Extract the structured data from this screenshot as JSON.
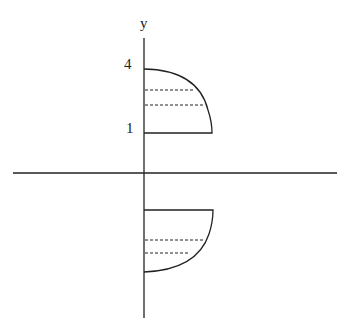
{
  "diagram": {
    "axis_label_y": "y",
    "tick_labels": [
      {
        "text": "4",
        "value": 4
      },
      {
        "text": "1",
        "value": 1
      }
    ],
    "shapes": [
      {
        "name": "upper-region",
        "description": "quarter-ellipse region between y=1 and y=4, right of y-axis, with two dashed horizontal slices"
      },
      {
        "name": "lower-region",
        "description": "mirrored quarter-ellipse region below x-axis, with two dashed horizontal slices"
      }
    ],
    "colors": {
      "stroke": "#222222",
      "background": "#ffffff"
    }
  }
}
